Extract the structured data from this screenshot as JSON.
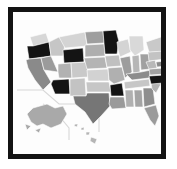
{
  "figure": {
    "kind": "framed-thumbnail",
    "title": "United States Choropleth Map",
    "frame_color": "#131313",
    "matte_color": "#ffffff",
    "canvas_color": "#fdfdfd",
    "frame": {
      "x": 8,
      "y": 7,
      "width": 158,
      "height": 152,
      "border_width": 5
    }
  },
  "map": {
    "name": "united-states-choropleth",
    "projection": "albers-usa",
    "stroke_color": "#ffffff",
    "stroke_width": 0.6,
    "has_insets": true,
    "insets": [
      {
        "name": "alaska-inset",
        "label": "Alaska",
        "fill": "#a9a9a9"
      },
      {
        "name": "hawaii-inset",
        "label": "Hawaii",
        "fill": "#b5b5b5"
      }
    ],
    "inset_divider_color": "#d8d8d8"
  },
  "legend": {
    "visible": false,
    "scale_type": "sequential-gray",
    "bins": [
      {
        "key": "very-light",
        "color": "#d7d7d7"
      },
      {
        "key": "light",
        "color": "#c3c3c3"
      },
      {
        "key": "medium-light",
        "color": "#b0b0b0"
      },
      {
        "key": "medium",
        "color": "#9b9b9b"
      },
      {
        "key": "medium-dark",
        "color": "#888888"
      },
      {
        "key": "dark",
        "color": "#6e6e6e"
      },
      {
        "key": "very-dark",
        "color": "#141414"
      }
    ]
  },
  "chart_data": {
    "type": "choropleth",
    "title": "United States Choropleth Map",
    "xlabel": "",
    "ylabel": "",
    "colorscale": "grayscale",
    "regions": [
      {
        "code": "WA",
        "name": "Washington",
        "bin": "very-light",
        "color": "#d7d7d7"
      },
      {
        "code": "OR",
        "name": "Oregon",
        "bin": "very-dark",
        "color": "#141414"
      },
      {
        "code": "CA",
        "name": "California",
        "bin": "medium-dark",
        "color": "#8a8a8a"
      },
      {
        "code": "NV",
        "name": "Nevada",
        "bin": "medium",
        "color": "#9b9b9b"
      },
      {
        "code": "ID",
        "name": "Idaho",
        "bin": "light",
        "color": "#c6c6c6"
      },
      {
        "code": "MT",
        "name": "Montana",
        "bin": "very-light",
        "color": "#d4d4d4"
      },
      {
        "code": "WY",
        "name": "Wyoming",
        "bin": "very-dark",
        "color": "#141414"
      },
      {
        "code": "UT",
        "name": "Utah",
        "bin": "medium-light",
        "color": "#b2b2b2"
      },
      {
        "code": "AZ",
        "name": "Arizona",
        "bin": "very-dark",
        "color": "#141414"
      },
      {
        "code": "CO",
        "name": "Colorado",
        "bin": "light",
        "color": "#c9c9c9"
      },
      {
        "code": "NM",
        "name": "New Mexico",
        "bin": "light",
        "color": "#c3c3c3"
      },
      {
        "code": "ND",
        "name": "North Dakota",
        "bin": "medium",
        "color": "#9e9e9e"
      },
      {
        "code": "SD",
        "name": "South Dakota",
        "bin": "medium-light",
        "color": "#aeaeae"
      },
      {
        "code": "NE",
        "name": "Nebraska",
        "bin": "medium-light",
        "color": "#b4b4b4"
      },
      {
        "code": "KS",
        "name": "Kansas",
        "bin": "very-light",
        "color": "#d2d2d2"
      },
      {
        "code": "OK",
        "name": "Oklahoma",
        "bin": "light",
        "color": "#c6c6c6"
      },
      {
        "code": "TX",
        "name": "Texas",
        "bin": "dark",
        "color": "#767676"
      },
      {
        "code": "MN",
        "name": "Minnesota",
        "bin": "very-dark",
        "color": "#141414"
      },
      {
        "code": "IA",
        "name": "Iowa",
        "bin": "light",
        "color": "#c0c0c0"
      },
      {
        "code": "MO",
        "name": "Missouri",
        "bin": "medium-light",
        "color": "#b0b0b0"
      },
      {
        "code": "AR",
        "name": "Arkansas",
        "bin": "very-dark",
        "color": "#141414"
      },
      {
        "code": "LA",
        "name": "Louisiana",
        "bin": "medium",
        "color": "#9a9a9a"
      },
      {
        "code": "WI",
        "name": "Wisconsin",
        "bin": "very-light",
        "color": "#d4d4d4"
      },
      {
        "code": "IL",
        "name": "Illinois",
        "bin": "medium",
        "color": "#9d9d9d"
      },
      {
        "code": "MI",
        "name": "Michigan",
        "bin": "very-light",
        "color": "#d9d9d9"
      },
      {
        "code": "IN",
        "name": "Indiana",
        "bin": "medium-light",
        "color": "#b6b6b6"
      },
      {
        "code": "OH",
        "name": "Ohio",
        "bin": "medium",
        "color": "#a0a0a0"
      },
      {
        "code": "KY",
        "name": "Kentucky",
        "bin": "medium-dark",
        "color": "#8c8c8c"
      },
      {
        "code": "TN",
        "name": "Tennessee",
        "bin": "light",
        "color": "#c6c6c6"
      },
      {
        "code": "MS",
        "name": "Mississippi",
        "bin": "medium-light",
        "color": "#b0b0b0"
      },
      {
        "code": "AL",
        "name": "Alabama",
        "bin": "medium",
        "color": "#a4a4a4"
      },
      {
        "code": "GA",
        "name": "Georgia",
        "bin": "medium-dark",
        "color": "#8e8e8e"
      },
      {
        "code": "FL",
        "name": "Florida",
        "bin": "medium",
        "color": "#9b9b9b"
      },
      {
        "code": "SC",
        "name": "South Carolina",
        "bin": "medium-light",
        "color": "#b4b4b4"
      },
      {
        "code": "NC",
        "name": "North Carolina",
        "bin": "very-dark",
        "color": "#141414"
      },
      {
        "code": "VA",
        "name": "Virginia",
        "bin": "medium",
        "color": "#a2a2a2"
      },
      {
        "code": "WV",
        "name": "West Virginia",
        "bin": "medium-light",
        "color": "#b8b8b8"
      },
      {
        "code": "MD",
        "name": "Maryland",
        "bin": "medium-dark",
        "color": "#8a8a8a"
      },
      {
        "code": "DE",
        "name": "Delaware",
        "bin": "medium",
        "color": "#9f9f9f"
      },
      {
        "code": "PA",
        "name": "Pennsylvania",
        "bin": "light",
        "color": "#c3c3c3"
      },
      {
        "code": "NJ",
        "name": "New Jersey",
        "bin": "medium-dark",
        "color": "#888888"
      },
      {
        "code": "NY",
        "name": "New York",
        "bin": "light",
        "color": "#c9c9c9"
      },
      {
        "code": "CT",
        "name": "Connecticut",
        "bin": "very-dark",
        "color": "#141414"
      },
      {
        "code": "RI",
        "name": "Rhode Island",
        "bin": "medium-dark",
        "color": "#8a8a8a"
      },
      {
        "code": "MA",
        "name": "Massachusetts",
        "bin": "very-dark",
        "color": "#1a1a1a"
      },
      {
        "code": "VT",
        "name": "Vermont",
        "bin": "medium-light",
        "color": "#b6b6b6"
      },
      {
        "code": "NH",
        "name": "New Hampshire",
        "bin": "medium",
        "color": "#a6a6a6"
      },
      {
        "code": "ME",
        "name": "Maine",
        "bin": "very-light",
        "color": "#d2d2d2"
      },
      {
        "code": "AK",
        "name": "Alaska",
        "bin": "medium",
        "color": "#a9a9a9"
      },
      {
        "code": "HI",
        "name": "Hawaii",
        "bin": "medium-light",
        "color": "#b5b5b5"
      }
    ]
  }
}
